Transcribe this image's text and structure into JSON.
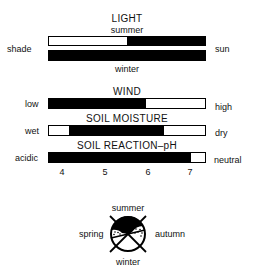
{
  "light": {
    "title": "LIGHT",
    "top_label": "summer",
    "bottom_label": "winter",
    "left_label": "shade",
    "right_label": "sun",
    "summer_bar": {
      "black_from_pct": 50,
      "black_to_pct": 100
    },
    "winter_bar": {
      "black_from_pct": 0,
      "black_to_pct": 100
    }
  },
  "wind": {
    "title": "WIND",
    "left_label": "low",
    "right_label": "high",
    "bar": {
      "black_from_pct": 0,
      "black_to_pct": 62
    }
  },
  "soil_moisture": {
    "title": "SOIL MOISTURE",
    "left_label": "wet",
    "right_label": "dry",
    "bar": {
      "black_from_pct": 12.5,
      "black_to_pct": 74
    }
  },
  "soil_reaction": {
    "title": "SOIL REACTION–pH",
    "left_label": "acidic",
    "right_label": "neutral",
    "bar": {
      "black_from_pct": 0,
      "black_to_pct": 91
    },
    "ticks": [
      "4",
      "5",
      "6",
      "7"
    ]
  },
  "seasons": {
    "top": "summer",
    "bottom": "winter",
    "left": "spring",
    "right": "autumn"
  }
}
